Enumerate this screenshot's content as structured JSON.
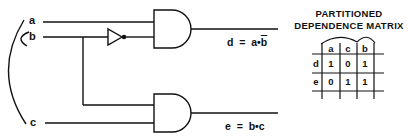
{
  "circuit": {
    "inputs": [
      {
        "name": "a",
        "label": "a"
      },
      {
        "name": "b",
        "label": "b"
      },
      {
        "name": "c",
        "label": "c"
      }
    ],
    "gates": [
      {
        "type": "NOT",
        "input": "b"
      },
      {
        "type": "AND",
        "inputs": [
          "a",
          "not b"
        ],
        "output": "d"
      },
      {
        "type": "AND",
        "inputs": [
          "b",
          "c"
        ],
        "output": "e"
      }
    ],
    "outputs": {
      "d": {
        "lhs": "d",
        "eq": "=",
        "t1": "a",
        "op": "•",
        "t2": "b",
        "t2_negated": true
      },
      "e": {
        "lhs": "e",
        "eq": "=",
        "t1": "b",
        "op": "•",
        "t2": "c",
        "t2_negated": false
      }
    }
  },
  "matrix": {
    "title_line1": "PARTITIONED",
    "title_line2": "DEPENDENCE MATRIX",
    "columns": [
      "a",
      "c",
      "b"
    ],
    "rows": [
      {
        "label": "d",
        "values": [
          "1",
          "0",
          "1"
        ]
      },
      {
        "label": "e",
        "values": [
          "0",
          "1",
          "1"
        ]
      }
    ]
  }
}
